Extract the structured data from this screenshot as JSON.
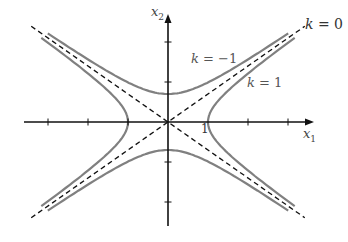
{
  "diagram": {
    "origin_px": [
      168,
      122
    ],
    "unit_px": 40,
    "b_ratio": 0.7,
    "colors": {
      "axis": "#111111",
      "curve": "#808080",
      "asymptote": "#111111",
      "text": "#444444"
    },
    "axes": {
      "x": {
        "label_main": "x",
        "label_sub": "1",
        "from": -3.6,
        "to": 3.6,
        "ticks": [
          -3,
          -2,
          -1,
          1,
          2,
          3
        ]
      },
      "y": {
        "label_main": "x",
        "label_sub": "2",
        "from": -2.6,
        "to": 2.65,
        "ticks": [
          -3,
          -2,
          -1,
          1,
          2,
          3
        ]
      }
    },
    "tick_labels": [
      {
        "text": "1",
        "x": 1
      }
    ],
    "curves": [
      {
        "name": "k = 1",
        "label": "k = 1",
        "k": 1,
        "branches": [
          "right",
          "left"
        ]
      },
      {
        "name": "k = -1",
        "label": "k = −1",
        "k": -1,
        "branches": [
          "top",
          "bottom"
        ]
      },
      {
        "name": "k = 0",
        "label": "k = 0",
        "k": 0,
        "type": "asymptotes"
      }
    ],
    "labels": {
      "k0": "k = 0",
      "k_neg1": "k = −1",
      "k_pos1": "k = 1",
      "x1_main": "x",
      "x1_sub": "1",
      "x2_main": "x",
      "x2_sub": "2",
      "tick_one": "1"
    }
  }
}
